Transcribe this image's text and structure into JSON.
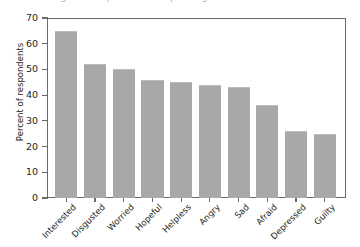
{
  "figure": {
    "top_cropped_caption": "Percentage of respondents reporting each emotion"
  },
  "chart_data": {
    "type": "bar",
    "title": "",
    "xlabel": "",
    "ylabel": "Percent of respondents",
    "categories": [
      "Interested",
      "Disgusted",
      "Worried",
      "Hopeful",
      "Helpless",
      "Angry",
      "Sad",
      "Afraid",
      "Depressed",
      "Guilty"
    ],
    "values": [
      65,
      52,
      50,
      46,
      45,
      44,
      43,
      36,
      26,
      25
    ],
    "ylim": [
      0,
      70
    ],
    "yticks": [
      0,
      10,
      20,
      30,
      40,
      50,
      60,
      70
    ],
    "ytick_labels": [
      "0",
      "10",
      "20",
      "30",
      "40",
      "50",
      "60",
      "70"
    ],
    "grid": false,
    "legend": null,
    "bar_color": "#a8a8a8",
    "axis_color": "#6b6b6b"
  }
}
